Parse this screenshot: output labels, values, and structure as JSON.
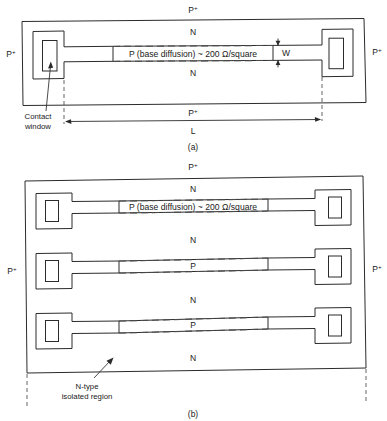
{
  "figure": {
    "panels": [
      {
        "id": "a",
        "caption": "(a)",
        "labels": {
          "top_region": "P",
          "top_region_sup": "+",
          "bottom_region": "P",
          "bottom_region_sup": "+",
          "left_region": "P",
          "left_region_sup": "+",
          "right_region": "P",
          "right_region_sup": "+",
          "n_upper": "N",
          "n_lower": "N",
          "strip_text": "P (base diffusion) ~ 200 Ω/square",
          "length_dim": "L",
          "width_dim": "W",
          "contact_note_line1": "Contact",
          "contact_note_line2": "window"
        }
      },
      {
        "id": "b",
        "caption": "(b)",
        "labels": {
          "top_region": "P",
          "top_region_sup": "+",
          "left_region": "P",
          "left_region_sup": "+",
          "right_region": "P",
          "right_region_sup": "+",
          "strip_text": "P (base diffusion) ~ 200 Ω/square",
          "isolation_note_line1": "N-type",
          "isolation_note_line2": "isolated region"
        },
        "band_sequence": [
          "N",
          "P",
          "N",
          "P",
          "N",
          "P",
          "N"
        ],
        "strip_count": 3,
        "contact_pads": 6
      }
    ],
    "colors": {
      "line": "#2b2b2b",
      "dash": "#4a4a4a",
      "text": "#1a1a1a",
      "background": "#ffffff"
    }
  }
}
